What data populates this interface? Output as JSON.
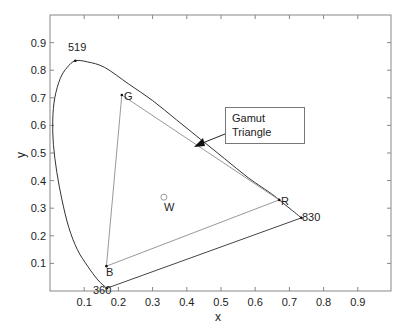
{
  "chart_data": {
    "type": "line",
    "title": "",
    "xlabel": "x",
    "ylabel": "y",
    "xlim": [
      0,
      1
    ],
    "ylim": [
      0,
      1
    ],
    "x_ticks": [
      0.1,
      0.2,
      0.3,
      0.4,
      0.5,
      0.6,
      0.7,
      0.8,
      0.9
    ],
    "y_ticks": [
      0.1,
      0.2,
      0.3,
      0.4,
      0.5,
      0.6,
      0.7,
      0.8,
      0.9
    ],
    "grid": false,
    "series": [
      {
        "name": "spectral locus",
        "points": [
          [
            0.166,
            0.01
          ],
          [
            0.14,
            0.04
          ],
          [
            0.11,
            0.09
          ],
          [
            0.08,
            0.15
          ],
          [
            0.055,
            0.23
          ],
          [
            0.035,
            0.33
          ],
          [
            0.02,
            0.43
          ],
          [
            0.01,
            0.53
          ],
          [
            0.008,
            0.62
          ],
          [
            0.014,
            0.7
          ],
          [
            0.03,
            0.77
          ],
          [
            0.05,
            0.81
          ],
          [
            0.074,
            0.834
          ],
          [
            0.11,
            0.83
          ],
          [
            0.16,
            0.81
          ],
          [
            0.23,
            0.75
          ],
          [
            0.3,
            0.69
          ],
          [
            0.37,
            0.62
          ],
          [
            0.44,
            0.55
          ],
          [
            0.51,
            0.48
          ],
          [
            0.58,
            0.41
          ],
          [
            0.65,
            0.35
          ],
          [
            0.69,
            0.31
          ],
          [
            0.735,
            0.265
          ]
        ]
      },
      {
        "name": "line of purples",
        "points": [
          [
            0.166,
            0.01
          ],
          [
            0.735,
            0.265
          ]
        ]
      },
      {
        "name": "gamut triangle",
        "points": [
          [
            0.21,
            0.71
          ],
          [
            0.67,
            0.33
          ],
          [
            0.165,
            0.09
          ],
          [
            0.21,
            0.71
          ]
        ]
      }
    ],
    "points": [
      {
        "label": "G",
        "x": 0.21,
        "y": 0.71
      },
      {
        "label": "R",
        "x": 0.67,
        "y": 0.33
      },
      {
        "label": "B",
        "x": 0.165,
        "y": 0.09
      },
      {
        "label": "W",
        "x": 0.333,
        "y": 0.34
      },
      {
        "label": "519",
        "x": 0.074,
        "y": 0.834
      },
      {
        "label": "830",
        "x": 0.735,
        "y": 0.265
      },
      {
        "label": "360",
        "x": 0.166,
        "y": 0.01
      }
    ],
    "annotations": [
      {
        "text": "Gamut Triangle",
        "arrow_to": [
          0.42,
          0.52
        ]
      }
    ]
  },
  "labels": {
    "xlabel": "x",
    "ylabel": "y",
    "G": "G",
    "R": "R",
    "B": "B",
    "W": "W",
    "wl519": "519",
    "wl830": "830",
    "wl360": "360",
    "anno_line1": "Gamut",
    "anno_line2": "Triangle"
  },
  "ticks": {
    "x": [
      "0.1",
      "0.2",
      "0.3",
      "0.4",
      "0.5",
      "0.6",
      "0.7",
      "0.8",
      "0.9"
    ],
    "y": [
      "0.1",
      "0.2",
      "0.3",
      "0.4",
      "0.5",
      "0.6",
      "0.7",
      "0.8",
      "0.9"
    ]
  }
}
